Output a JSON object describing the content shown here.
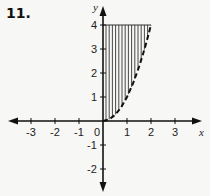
{
  "problem_number": "11.",
  "chart_data": {
    "type": "area",
    "title": "",
    "xlabel": "x",
    "ylabel": "y",
    "xlim": [
      -3.8,
      4
    ],
    "ylim": [
      -2.8,
      4.5
    ],
    "x_ticks": [
      -3,
      -2,
      -1,
      0,
      1,
      2,
      3
    ],
    "x_tick_labels": [
      "-3",
      "-2",
      "-1",
      "0",
      "1",
      "2",
      "3"
    ],
    "y_ticks": [
      -2,
      -1,
      1,
      2,
      3,
      4
    ],
    "y_tick_labels": [
      "-2",
      "-1",
      "1",
      "2",
      "3",
      "4"
    ],
    "grid": false,
    "legend": null,
    "series": [
      {
        "name": "boundary curve y = x^2",
        "style": "dashed",
        "x": [
          0,
          0.25,
          0.5,
          0.75,
          1,
          1.25,
          1.5,
          1.75,
          2
        ],
        "y": [
          0,
          0.0625,
          0.25,
          0.5625,
          1,
          1.5625,
          2.25,
          3.0625,
          4
        ]
      }
    ],
    "shaded_region": {
      "description": "Vertical hatching between y-axis (x=0) and curve y=x^2, for 0 <= y <= 4",
      "x_range": [
        0,
        2
      ],
      "y_range": [
        0,
        4
      ],
      "hatch": "vertical"
    }
  }
}
